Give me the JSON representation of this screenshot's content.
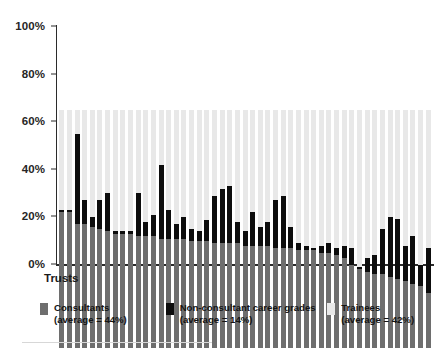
{
  "chart": {
    "type": "bar",
    "title": "",
    "xlabel": "Trusts",
    "ylabel": ""
  },
  "axis": {
    "y_ticks": [
      "100%",
      "80%",
      "60%",
      "40%",
      "20%",
      "0%"
    ],
    "y_tick_values": [
      100,
      80,
      60,
      40,
      20,
      0
    ]
  },
  "legend": {
    "items": [
      {
        "label": "Consultants",
        "sub": "(average = 44%)",
        "color": "#6e6e6e",
        "swatch_name": "consultants-swatch"
      },
      {
        "label": "Non-consultant career grades",
        "sub": "(average = 14%)",
        "color": "#0d0d0d",
        "swatch_name": "non-consultant-career-grades-swatch"
      },
      {
        "label": "Trainees",
        "sub": "(average = 42%)",
        "color": "#e8e8e8",
        "swatch_name": "trainees-swatch"
      }
    ]
  },
  "chart_data": {
    "type": "bar",
    "stacked": true,
    "title": "",
    "xlabel": "Trusts",
    "ylabel": "",
    "ylim": [
      0,
      100
    ],
    "yticks": [
      0,
      20,
      40,
      60,
      80,
      100
    ],
    "ytick_labels": [
      "0%",
      "20%",
      "40%",
      "60%",
      "80%",
      "100%"
    ],
    "grid": false,
    "legend_position": "bottom",
    "categories": [
      "T1",
      "T2",
      "T3",
      "T4",
      "T5",
      "T6",
      "T7",
      "T8",
      "T9",
      "T10",
      "T11",
      "T12",
      "T13",
      "T14",
      "T15",
      "T16",
      "T17",
      "T18",
      "T19",
      "T20",
      "T21",
      "T22",
      "T23",
      "T24",
      "T25",
      "T26",
      "T27",
      "T28",
      "T29",
      "T30",
      "T31",
      "T32",
      "T33",
      "T34",
      "T35",
      "T36",
      "T37",
      "T38",
      "T39",
      "T40",
      "T41",
      "T42",
      "T43",
      "T44",
      "T45",
      "T46",
      "T47",
      "T48",
      "T49"
    ],
    "series": [
      {
        "name": "Consultants",
        "color": "#6e6e6e",
        "average": 44,
        "values": [
          57,
          57,
          52,
          52,
          51,
          50,
          49,
          48,
          48,
          48,
          47,
          47,
          47,
          46,
          46,
          46,
          46,
          45,
          45,
          45,
          44,
          44,
          44,
          44,
          43,
          43,
          43,
          43,
          42,
          42,
          42,
          41,
          41,
          41,
          40,
          40,
          39,
          38,
          35,
          33,
          32,
          31,
          31,
          30,
          29,
          28,
          27,
          26,
          23
        ]
      },
      {
        "name": "Non-consultant career grades",
        "color": "#0d0d0d",
        "average": 14,
        "values": [
          1,
          1,
          38,
          10,
          4,
          12,
          16,
          1,
          1,
          1,
          18,
          6,
          9,
          31,
          12,
          6,
          9,
          5,
          4,
          9,
          20,
          23,
          24,
          9,
          6,
          14,
          8,
          10,
          20,
          22,
          9,
          3,
          2,
          1,
          3,
          4,
          3,
          5,
          7,
          1,
          6,
          8,
          19,
          25,
          25,
          15,
          20,
          9,
          19
        ]
      },
      {
        "name": "Trainees",
        "color": "#e8e8e8",
        "average": 42,
        "values": [
          42,
          42,
          10,
          38,
          45,
          38,
          35,
          51,
          51,
          51,
          35,
          47,
          44,
          23,
          42,
          48,
          45,
          50,
          51,
          46,
          36,
          33,
          32,
          47,
          51,
          43,
          49,
          47,
          38,
          36,
          49,
          56,
          57,
          58,
          57,
          56,
          58,
          57,
          58,
          66,
          62,
          61,
          50,
          45,
          46,
          57,
          53,
          65,
          58
        ]
      }
    ]
  }
}
